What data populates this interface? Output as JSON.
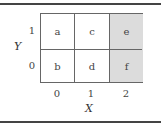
{
  "diagram": {
    "x_axis": {
      "label": "X",
      "ticks": [
        "0",
        "1",
        "2"
      ]
    },
    "y_axis": {
      "label": "Y",
      "ticks": [
        "1",
        "0"
      ]
    },
    "cells": [
      {
        "label": "a",
        "x": 0,
        "y": 1,
        "shaded": false
      },
      {
        "label": "c",
        "x": 1,
        "y": 1,
        "shaded": false
      },
      {
        "label": "e",
        "x": 2,
        "y": 1,
        "shaded": true
      },
      {
        "label": "b",
        "x": 0,
        "y": 0,
        "shaded": false
      },
      {
        "label": "d",
        "x": 1,
        "y": 0,
        "shaded": false
      },
      {
        "label": "f",
        "x": 2,
        "y": 0,
        "shaded": true
      }
    ],
    "colors": {
      "shade": "#dcdcdc",
      "border": "#666666",
      "rule": "#444444"
    }
  }
}
